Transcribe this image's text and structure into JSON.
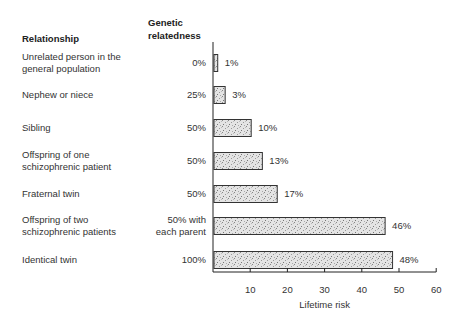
{
  "chart_data": {
    "type": "bar",
    "orientation": "horizontal",
    "title": "",
    "column_headers": {
      "relationship": "Relationship",
      "genetic_relatedness": [
        "Genetic",
        "relatedness"
      ]
    },
    "categories": [
      [
        "Unrelated person in the",
        "general population"
      ],
      [
        "Nephew or niece"
      ],
      [
        "Sibling"
      ],
      [
        "Offspring of one",
        "schizophrenic patient"
      ],
      [
        "Fraternal twin"
      ],
      [
        "Offspring of two",
        "schizophrenic patients"
      ],
      [
        "Identical twin"
      ]
    ],
    "genetic_relatedness": [
      [
        "0%"
      ],
      [
        "25%"
      ],
      [
        "50%"
      ],
      [
        "50%"
      ],
      [
        "50%"
      ],
      [
        "50% with",
        "each parent"
      ],
      [
        "100%"
      ]
    ],
    "values": [
      1,
      3,
      10,
      13,
      17,
      46,
      48
    ],
    "value_labels": [
      "1%",
      "3%",
      "10%",
      "13%",
      "17%",
      "46%",
      "48%"
    ],
    "xlabel": "Lifetime risk",
    "ylabel": "",
    "xlim": [
      0,
      60
    ],
    "xticks": [
      10,
      20,
      30,
      40,
      50,
      60
    ],
    "grid": false,
    "legend": "none"
  }
}
